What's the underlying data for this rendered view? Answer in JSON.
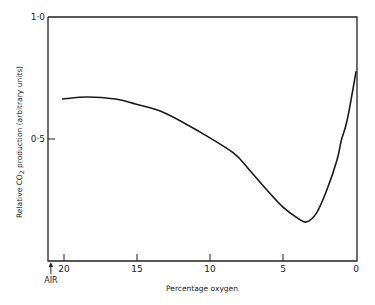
{
  "chart_data": {
    "type": "line",
    "title": "",
    "xlabel": "Percentage oxygen",
    "ylabel": "Relative CO",
    "ylabel_subscript": "2",
    "ylabel_suffix": " production (arbitrary units)",
    "xlim": [
      20,
      0
    ],
    "ylim": [
      0,
      1.0
    ],
    "x_reversed": true,
    "grid": false,
    "x_ticks": [
      20,
      15,
      10,
      5,
      0
    ],
    "x_tick_labels": [
      "20",
      "15",
      "10",
      "5",
      "0"
    ],
    "y_ticks": [
      0.5,
      1.0
    ],
    "y_tick_labels": [
      "0·5",
      "1·0"
    ],
    "annotations": [
      {
        "text": "AIR",
        "x": 20.9,
        "type": "arrow-up"
      }
    ],
    "series": [
      {
        "name": "CO2 production",
        "color": "#1a1a1a",
        "x": [
          20.1,
          18.4,
          16.5,
          15.1,
          13.1,
          10.7,
          8.4,
          7.3,
          6.1,
          5.0,
          4.0,
          3.4,
          2.7,
          2.0,
          1.3,
          1.0,
          0.6,
          0.0
        ],
        "y": [
          0.664,
          0.672,
          0.664,
          0.643,
          0.607,
          0.529,
          0.443,
          0.373,
          0.291,
          0.221,
          0.176,
          0.16,
          0.197,
          0.291,
          0.414,
          0.496,
          0.578,
          0.775
        ]
      }
    ]
  }
}
